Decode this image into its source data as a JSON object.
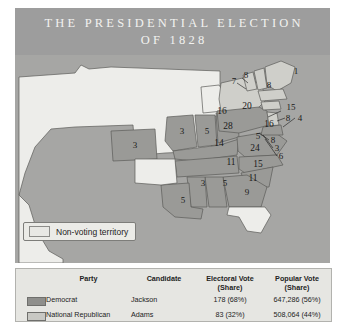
{
  "title": {
    "line1": "THE PRESIDENTIAL ELECTION",
    "line2": "OF 1828"
  },
  "map": {
    "legend": {
      "non_voting_label": "Non-voting territory",
      "non_voting_swatch_color": "#e8e8e4"
    },
    "colors": {
      "ocean": "#a6a6a4",
      "democrat_state": "#9a9a97",
      "national_republican_state": "#cfcfca",
      "non_voting_territory": "#ededea",
      "border": "#5c5c59"
    },
    "electoral_labels": [
      {
        "value": "8",
        "x": 231,
        "y": 20
      },
      {
        "value": "7",
        "x": 219,
        "y": 26
      },
      {
        "value": "1",
        "x": 281,
        "y": 16
      },
      {
        "value": "8",
        "x": 254,
        "y": 30
      },
      {
        "value": "20",
        "x": 232,
        "y": 52
      },
      {
        "value": "16",
        "x": 207,
        "y": 57
      },
      {
        "value": "15",
        "x": 276,
        "y": 52
      },
      {
        "value": "8",
        "x": 273,
        "y": 63
      },
      {
        "value": "4",
        "x": 285,
        "y": 63
      },
      {
        "value": "28",
        "x": 213,
        "y": 72
      },
      {
        "value": "16",
        "x": 254,
        "y": 70
      },
      {
        "value": "5",
        "x": 243,
        "y": 81
      },
      {
        "value": "8",
        "x": 258,
        "y": 85
      },
      {
        "value": "3",
        "x": 262,
        "y": 93
      },
      {
        "value": "6",
        "x": 266,
        "y": 101
      },
      {
        "value": "24",
        "x": 240,
        "y": 94
      },
      {
        "value": "3",
        "x": 167,
        "y": 76
      },
      {
        "value": "5",
        "x": 192,
        "y": 76
      },
      {
        "value": "14",
        "x": 204,
        "y": 89
      },
      {
        "value": "3",
        "x": 120,
        "y": 90
      },
      {
        "value": "15",
        "x": 243,
        "y": 110
      },
      {
        "value": "11",
        "x": 216,
        "y": 108
      },
      {
        "value": "11",
        "x": 238,
        "y": 124
      },
      {
        "value": "3",
        "x": 188,
        "y": 128
      },
      {
        "value": "5",
        "x": 210,
        "y": 128
      },
      {
        "value": "9",
        "x": 232,
        "y": 137
      },
      {
        "value": "5",
        "x": 168,
        "y": 145
      }
    ]
  },
  "results": {
    "headers": {
      "party": "Party",
      "candidate": "Candidate",
      "electoral_line1": "Electoral Vote",
      "electoral_line2": "(Share)",
      "popular_line1": "Popular Vote",
      "popular_line2": "(Share)"
    },
    "rows": [
      {
        "swatch": "#8f8f8c",
        "party": "Democrat",
        "candidate": "Jackson",
        "electoral": "178 (68%)",
        "popular": "647,286 (56%)"
      },
      {
        "swatch": "#c8c8c3",
        "party": "National Republican",
        "candidate": "Adams",
        "electoral": "83 (32%)",
        "popular": "508,064 (44%)"
      }
    ]
  }
}
